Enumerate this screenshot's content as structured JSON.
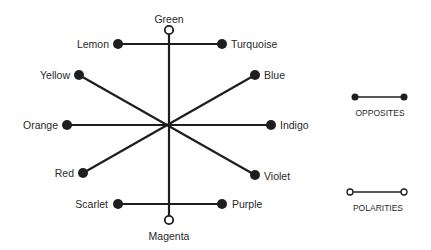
{
  "diagram": {
    "center": {
      "x": 169,
      "y": 125
    },
    "colors": {
      "line": "#1e1e1e",
      "text": "#2a2a2a",
      "background": "#ffffff"
    },
    "polarity": {
      "top": {
        "label": "Green",
        "x": 169,
        "y": 30
      },
      "bottom": {
        "label": "Magenta",
        "x": 169,
        "y": 220
      }
    },
    "opposites": [
      {
        "a": {
          "label": "Lemon",
          "x": 118,
          "y": 44
        },
        "b": {
          "label": "Turquoise",
          "x": 222,
          "y": 44
        }
      },
      {
        "a": {
          "label": "Yellow",
          "x": 79,
          "y": 75
        },
        "b": {
          "label": "Violet",
          "x": 255,
          "y": 175
        }
      },
      {
        "a": {
          "label": "Orange",
          "x": 67,
          "y": 125
        },
        "b": {
          "label": "Indigo",
          "x": 271,
          "y": 125
        }
      },
      {
        "a": {
          "label": "Red",
          "x": 83,
          "y": 173
        },
        "b": {
          "label": "Blue",
          "x": 255,
          "y": 75
        }
      },
      {
        "a": {
          "label": "Scarlet",
          "x": 118,
          "y": 204
        },
        "b": {
          "label": "Purple",
          "x": 222,
          "y": 204
        }
      }
    ]
  },
  "legend": {
    "opposites": {
      "label": "OPPOSITES"
    },
    "polarities": {
      "label": "POLARITIES"
    }
  }
}
